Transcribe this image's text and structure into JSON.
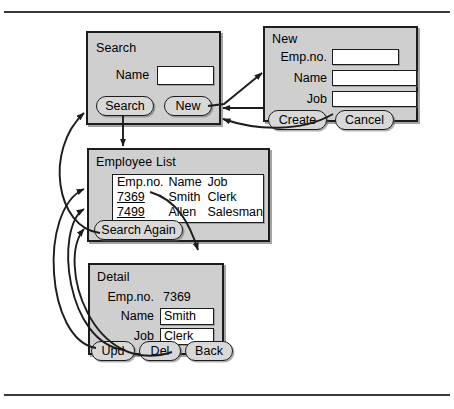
{
  "diagram": {
    "panel_bg": "#cfcfcf",
    "line_color": "#1c1c1c"
  },
  "screens": {
    "search": {
      "title": "Search",
      "fields": [
        {
          "label": "Name",
          "value": "",
          "type": "textbox"
        }
      ],
      "buttons": [
        {
          "label": "Search"
        },
        {
          "label": "New"
        }
      ]
    },
    "new": {
      "title": "New",
      "fields": [
        {
          "label": "Emp.no.",
          "value": "",
          "type": "textbox"
        },
        {
          "label": "Name",
          "value": "",
          "type": "textbox"
        },
        {
          "label": "Job",
          "value": "",
          "type": "textbox"
        }
      ],
      "buttons": [
        {
          "label": "Create"
        },
        {
          "label": "Cancel"
        }
      ]
    },
    "list": {
      "title": "Employee List",
      "table": {
        "headers": [
          "Emp.no.",
          "Name",
          "Job"
        ],
        "rows": [
          {
            "empno": "7369",
            "name": "Smith",
            "job": "Clerk",
            "link": true
          },
          {
            "empno": "7499",
            "name": "Allen",
            "job": "Salesman",
            "link": true
          }
        ]
      },
      "buttons": [
        {
          "label": "Search Again"
        }
      ]
    },
    "detail": {
      "title": "Detail",
      "fields": [
        {
          "label": "Emp.no.",
          "value": "7369",
          "type": "text"
        },
        {
          "label": "Name",
          "value": "Smith",
          "type": "textbox"
        },
        {
          "label": "Job",
          "value": "Clerk",
          "type": "textbox"
        }
      ],
      "buttons": [
        {
          "label": "Upd"
        },
        {
          "label": "Del"
        },
        {
          "label": "Back"
        }
      ]
    }
  }
}
